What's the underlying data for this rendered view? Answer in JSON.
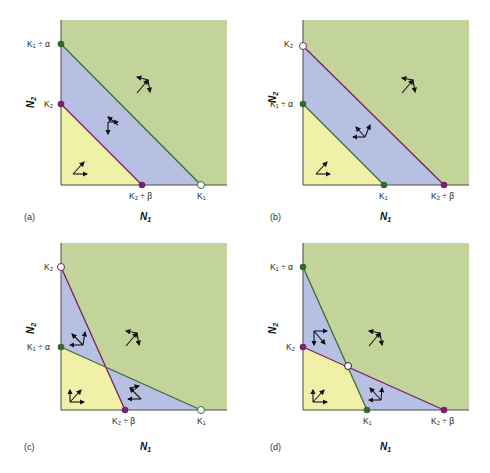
{
  "figure": {
    "colors": {
      "green_region": "#c2d49a",
      "blue_region": "#b7bfe3",
      "yellow_region": "#f0f0a8",
      "isocline_species1": "#3b6b3b",
      "isocline_species2": "#7a1f5c",
      "point_species1": "#2f6b2f",
      "point_species2": "#7a1f6b",
      "axis": "#4a4a4a"
    },
    "panels": [
      {
        "id": "a",
        "letter": "(a)",
        "xlabel": "N",
        "xlabel_sub": "1",
        "ylabel": "N",
        "ylabel_sub": "2",
        "y_labels": [
          {
            "text": "K₁ ÷ α",
            "pos": "top"
          },
          {
            "text": "K₂",
            "pos": "mid"
          }
        ],
        "x_labels": [
          {
            "text": "K₂ ÷ β",
            "pos": "mid"
          },
          {
            "text": "K₁",
            "pos": "right"
          }
        ],
        "outcome": "species 1 wins (stable at K1)"
      },
      {
        "id": "b",
        "letter": "(b)",
        "xlabel": "N",
        "xlabel_sub": "1",
        "ylabel": "N",
        "ylabel_sub": "2",
        "y_labels": [
          {
            "text": "K₂",
            "pos": "top"
          },
          {
            "text": "K₁ ÷ α",
            "pos": "mid"
          }
        ],
        "x_labels": [
          {
            "text": "K₁",
            "pos": "mid"
          },
          {
            "text": "K₂ ÷ β",
            "pos": "right"
          }
        ],
        "outcome": "species 2 wins (stable at K2)"
      },
      {
        "id": "c",
        "letter": "(c)",
        "xlabel": "N",
        "xlabel_sub": "1",
        "ylabel": "N",
        "ylabel_sub": "2",
        "y_labels": [
          {
            "text": "K₂",
            "pos": "top"
          },
          {
            "text": "K₁ ÷ α",
            "pos": "mid"
          }
        ],
        "x_labels": [
          {
            "text": "K₂ ÷ β",
            "pos": "mid"
          },
          {
            "text": "K₁",
            "pos": "right"
          }
        ],
        "outcome": "unstable equilibrium; either species may win"
      },
      {
        "id": "d",
        "letter": "(d)",
        "xlabel": "N",
        "xlabel_sub": "1",
        "ylabel": "N",
        "ylabel_sub": "2",
        "y_labels": [
          {
            "text": "K₁ ÷ α",
            "pos": "top"
          },
          {
            "text": "K₂",
            "pos": "mid"
          }
        ],
        "x_labels": [
          {
            "text": "K₁",
            "pos": "mid"
          },
          {
            "text": "K₂ ÷ β",
            "pos": "right"
          }
        ],
        "outcome": "stable coexistence equilibrium"
      }
    ]
  }
}
